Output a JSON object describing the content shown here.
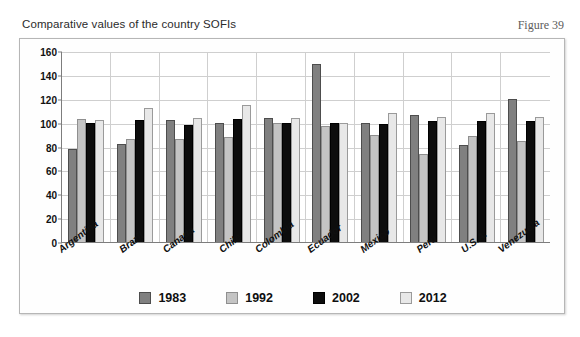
{
  "figure": {
    "caption": "Comparative values of the country SOFIs",
    "figure_number": "Figure 39"
  },
  "chart_data": {
    "type": "bar",
    "title": "Comparative values of the country SOFIs",
    "xlabel": "",
    "ylabel": "",
    "ylim": [
      0,
      160
    ],
    "ytick_step": 20,
    "yticks": [
      0,
      20,
      40,
      60,
      80,
      100,
      120,
      140,
      160
    ],
    "grid": true,
    "legend_position": "bottom",
    "categories": [
      "Argentina",
      "Brazil",
      "Canada",
      "Chile",
      "Colombia",
      "Ecuador",
      "Mexico",
      "Peru",
      "U.S.A.",
      "Venezuela"
    ],
    "series": [
      {
        "name": "1983",
        "color": "#808080",
        "values": [
          78,
          82,
          102,
          100,
          104,
          149,
          100,
          106,
          81,
          120
        ]
      },
      {
        "name": "1992",
        "color": "#c4c4c4",
        "values": [
          103,
          86,
          86,
          88,
          100,
          97,
          90,
          74,
          89,
          85
        ]
      },
      {
        "name": "2002",
        "color": "#0d0d0d",
        "values": [
          100,
          102,
          98,
          103,
          100,
          100,
          99,
          101,
          101,
          101
        ]
      },
      {
        "name": "2012",
        "color": "#e8e8e8",
        "values": [
          102,
          112,
          104,
          115,
          104,
          100,
          108,
          105,
          108,
          105
        ]
      }
    ]
  }
}
